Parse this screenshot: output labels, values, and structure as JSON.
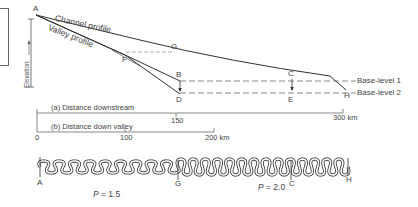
{
  "diagram": {
    "type": "longitudinal-profile-and-planform",
    "profile": {
      "axis_label": "Elevation",
      "lines": {
        "channel": "Channel profile",
        "valley": "Valley profile"
      },
      "points": {
        "A": "A",
        "B": "B",
        "C": "C",
        "D": "D",
        "E": "E",
        "F": "F",
        "G": "G",
        "H": "H"
      },
      "base_levels": [
        "Base-level 1",
        "Base-level 2"
      ]
    },
    "scales": {
      "downstream": {
        "label": "(a) Distance downstream",
        "ticks": [
          "150",
          "300 km"
        ]
      },
      "down_valley": {
        "label": "(b) Distance down valley",
        "ticks": [
          "0",
          "100",
          "200 km"
        ]
      }
    },
    "planform": {
      "points": {
        "A": "A",
        "G": "G",
        "C": "C",
        "H": "H"
      },
      "sinuosity": [
        {
          "symbol": "P",
          "value": "= 1.5"
        },
        {
          "symbol": "P",
          "value": "= 2.0"
        }
      ]
    },
    "colors": {
      "line": "#333333",
      "dash": "#555555",
      "text": "#444444"
    }
  }
}
